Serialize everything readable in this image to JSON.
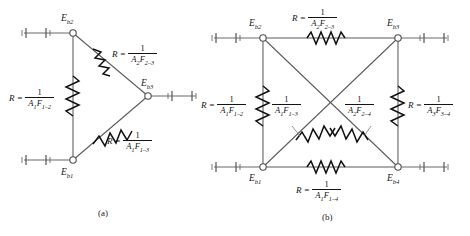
{
  "figure": {
    "type": "radiation-network-resistance-diagram",
    "background_color": "#ffffff",
    "line_color": "#5a5a5a",
    "text_color": "#141414",
    "subfigures": [
      {
        "id": "a",
        "caption": "(a)",
        "node_count": 3,
        "nodes": [
          {
            "id": "Eb1",
            "label": "E",
            "sub": "b1",
            "position": "bottom-left"
          },
          {
            "id": "Eb2",
            "label": "E",
            "sub": "b2",
            "position": "top-left"
          },
          {
            "id": "Eb3",
            "label": "E",
            "sub": "b3",
            "position": "middle-right"
          }
        ],
        "resistors": [
          {
            "id": "R12",
            "between": [
              "Eb1",
              "Eb2"
            ],
            "orientation": "vertical",
            "prefix": "R",
            "equals": "=",
            "numerator": "1",
            "denominator_A": "A",
            "denominator_A_sub": "1",
            "denominator_F": "F",
            "denominator_F_sub": "1–2"
          },
          {
            "id": "R23",
            "between": [
              "Eb2",
              "Eb3"
            ],
            "orientation": "diagonal",
            "prefix": "R",
            "equals": "=",
            "numerator": "1",
            "denominator_A": "A",
            "denominator_A_sub": "2",
            "denominator_F": "F",
            "denominator_F_sub": "2–3"
          },
          {
            "id": "R13",
            "between": [
              "Eb1",
              "Eb3"
            ],
            "orientation": "diagonal",
            "prefix": "R",
            "equals": "=",
            "numerator": "1",
            "denominator_A": "A",
            "denominator_A_sub": "1",
            "denominator_F": "F",
            "denominator_F_sub": "1–3"
          }
        ],
        "terminals": [
          "Eb1",
          "Eb2",
          "Eb3"
        ]
      },
      {
        "id": "b",
        "caption": "(b)",
        "node_count": 4,
        "nodes": [
          {
            "id": "Eb1",
            "label": "E",
            "sub": "b1",
            "position": "bottom-left"
          },
          {
            "id": "Eb2",
            "label": "E",
            "sub": "b2",
            "position": "top-left"
          },
          {
            "id": "Eb3",
            "label": "E",
            "sub": "b3",
            "position": "top-right"
          },
          {
            "id": "Eb4",
            "label": "E",
            "sub": "b4",
            "position": "bottom-right"
          }
        ],
        "resistors": [
          {
            "id": "R23",
            "between": [
              "Eb2",
              "Eb3"
            ],
            "orientation": "horizontal-top",
            "prefix": "R",
            "equals": "=",
            "show_prefix": true,
            "numerator": "1",
            "denominator_A": "A",
            "denominator_A_sub": "2",
            "denominator_F": "F",
            "denominator_F_sub": "2–3"
          },
          {
            "id": "R12",
            "between": [
              "Eb1",
              "Eb2"
            ],
            "orientation": "vertical-left",
            "prefix": "R",
            "equals": "=",
            "show_prefix": true,
            "numerator": "1",
            "denominator_A": "A",
            "denominator_A_sub": "1",
            "denominator_F": "F",
            "denominator_F_sub": "1–2"
          },
          {
            "id": "R13",
            "between": [
              "Eb1",
              "Eb3"
            ],
            "orientation": "diagonal-rising",
            "prefix": "",
            "equals": "",
            "show_prefix": false,
            "numerator": "1",
            "denominator_A": "A",
            "denominator_A_sub": "1",
            "denominator_F": "F",
            "denominator_F_sub": "1–3"
          },
          {
            "id": "R24",
            "between": [
              "Eb2",
              "Eb4"
            ],
            "orientation": "diagonal-falling",
            "prefix": "",
            "equals": "",
            "show_prefix": false,
            "numerator": "1",
            "denominator_A": "A",
            "denominator_A_sub": "2",
            "denominator_F": "F",
            "denominator_F_sub": "2–4"
          },
          {
            "id": "R34",
            "between": [
              "Eb3",
              "Eb4"
            ],
            "orientation": "vertical-right",
            "prefix": "R",
            "equals": "=",
            "show_prefix": true,
            "numerator": "1",
            "denominator_A": "A",
            "denominator_A_sub": "3",
            "denominator_F": "F",
            "denominator_F_sub": "3–4"
          },
          {
            "id": "R14",
            "between": [
              "Eb1",
              "Eb4"
            ],
            "orientation": "horizontal-bottom",
            "prefix": "R",
            "equals": "=",
            "show_prefix": true,
            "numerator": "1",
            "denominator_A": "A",
            "denominator_A_sub": "1",
            "denominator_F": "F",
            "denominator_F_sub": "1–4"
          }
        ],
        "terminals": [
          "Eb1",
          "Eb2",
          "Eb3",
          "Eb4"
        ]
      }
    ]
  }
}
